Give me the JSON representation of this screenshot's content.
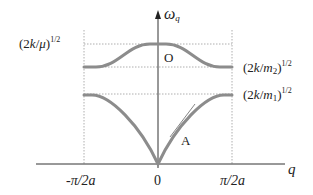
{
  "diagram": {
    "type": "phonon-dispersion",
    "axes": {
      "y_label": "ω",
      "y_label_sub": "q",
      "x_label": "q",
      "x_ticks": [
        "-π/2a",
        "0",
        "π/2a"
      ]
    },
    "levels": {
      "top": {
        "text_pre": "(2",
        "var": "k",
        "slash": "/",
        "denom": "μ",
        "close": ")",
        "exp": "1/2"
      },
      "m2": {
        "text_pre": "(2",
        "var": "k",
        "slash": "/",
        "denom": "m",
        "denom_sub": "2",
        "close": ")",
        "exp": "1/2"
      },
      "m1": {
        "text_pre": "(2",
        "var": "k",
        "slash": "/",
        "denom": "m",
        "denom_sub": "1",
        "close": ")",
        "exp": "1/2"
      }
    },
    "branches": {
      "optical": {
        "label": "O"
      },
      "acoustic": {
        "label": "A"
      }
    },
    "colors": {
      "curve": "#8c8c8c",
      "axis": "#333333",
      "guide": "#999999"
    }
  }
}
